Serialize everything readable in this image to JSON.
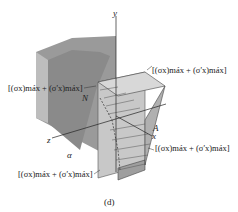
{
  "figure": {
    "caption": "(d)",
    "axes": {
      "y": "y",
      "x": "x",
      "z": "z"
    },
    "points": {
      "A": "A",
      "N": "N",
      "alpha": "α"
    },
    "stress_labels": [
      {
        "id": "top-right",
        "text": "(σx)máx + (σ'x)máx"
      },
      {
        "id": "top-left",
        "text": "(σx)máx + (σ'x)máx"
      },
      {
        "id": "bottom-right",
        "text": "(σx)máx + (σ'x)máx"
      },
      {
        "id": "bottom-left",
        "text": "(σx)máx + (σ'x)máx"
      }
    ]
  }
}
